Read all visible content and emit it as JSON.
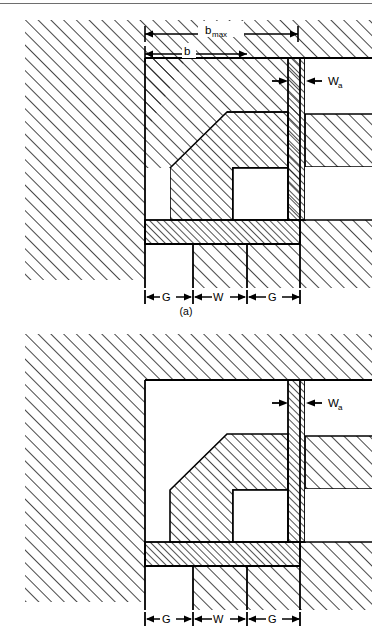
{
  "document": {
    "type": "technical-cross-section-diagram",
    "figure_count": 2,
    "line_color": "#000000",
    "hatch_color": "#1a1a1a",
    "background_color": "#ffffff",
    "rule_color": "#6e6e6e"
  },
  "figure_a": {
    "caption": "(a)",
    "labels": {
      "b_max_base": "b",
      "b_max_sub": "max",
      "b": "b",
      "wa_base": "W",
      "wa_sub": "a",
      "gap_left": "G",
      "width": "W",
      "gap_right": "G"
    },
    "dimensions": [
      {
        "name": "b_max",
        "label": "bmax",
        "orientation": "horizontal",
        "position": "top"
      },
      {
        "name": "b",
        "label": "b",
        "orientation": "horizontal",
        "position": "top"
      },
      {
        "name": "W_a",
        "label": "Wa",
        "orientation": "horizontal",
        "position": "right"
      },
      {
        "name": "G_left",
        "label": "G",
        "orientation": "horizontal",
        "position": "bottom"
      },
      {
        "name": "W",
        "label": "W",
        "orientation": "horizontal",
        "position": "bottom"
      },
      {
        "name": "G_right",
        "label": "G",
        "orientation": "horizontal",
        "position": "bottom"
      }
    ]
  },
  "figure_b": {
    "caption": "",
    "labels": {
      "wa_base": "W",
      "wa_sub": "a",
      "gap_left": "G",
      "width": "W",
      "gap_right": "G"
    },
    "dimensions": [
      {
        "name": "W_a",
        "label": "Wa",
        "orientation": "horizontal",
        "position": "right"
      },
      {
        "name": "G_left",
        "label": "G",
        "orientation": "horizontal",
        "position": "bottom"
      },
      {
        "name": "W",
        "label": "W",
        "orientation": "horizontal",
        "position": "bottom"
      },
      {
        "name": "G_right",
        "label": "G",
        "orientation": "horizontal",
        "position": "bottom"
      }
    ]
  }
}
